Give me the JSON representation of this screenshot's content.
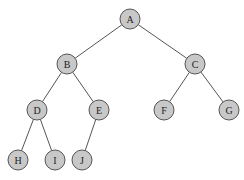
{
  "diagram": {
    "type": "binary-tree",
    "colors": {
      "node_fill": "#c8c8c8",
      "node_stroke": "#555555",
      "edge": "#555555",
      "background": "#ffffff"
    },
    "nodes": [
      {
        "id": "A",
        "label": "A",
        "x": 130,
        "y": 19
      },
      {
        "id": "B",
        "label": "B",
        "x": 67,
        "y": 64
      },
      {
        "id": "C",
        "label": "C",
        "x": 195,
        "y": 64
      },
      {
        "id": "D",
        "label": "D",
        "x": 37,
        "y": 110
      },
      {
        "id": "E",
        "label": "E",
        "x": 99,
        "y": 110
      },
      {
        "id": "F",
        "label": "F",
        "x": 164,
        "y": 110
      },
      {
        "id": "G",
        "label": "G",
        "x": 229,
        "y": 110
      },
      {
        "id": "H",
        "label": "H",
        "x": 18,
        "y": 160
      },
      {
        "id": "I",
        "label": "I",
        "x": 55,
        "y": 160
      },
      {
        "id": "J",
        "label": "J",
        "x": 82,
        "y": 160
      }
    ],
    "edges": [
      [
        "A",
        "B"
      ],
      [
        "A",
        "C"
      ],
      [
        "B",
        "D"
      ],
      [
        "B",
        "E"
      ],
      [
        "C",
        "F"
      ],
      [
        "C",
        "G"
      ],
      [
        "D",
        "H"
      ],
      [
        "D",
        "I"
      ],
      [
        "E",
        "J"
      ]
    ],
    "node_radius": 10
  }
}
